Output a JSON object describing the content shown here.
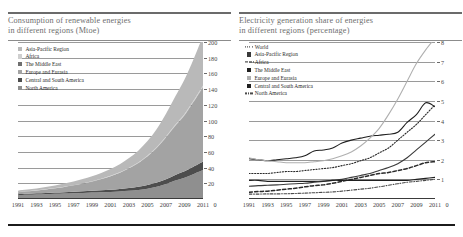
{
  "figure": {
    "bottom_rule_color": "#1b1b1b"
  },
  "left_panel": {
    "title_line1": "Consumption of renewable energies",
    "title_line2": "in different regions (Mtoe)",
    "legend": [
      {
        "label": "Asia-Pacific Region",
        "style": "swatch",
        "color": "#b9b9b9"
      },
      {
        "label": "Africa",
        "style": "swatch",
        "color": "#cfcfcf"
      },
      {
        "label": "The Middle East",
        "style": "swatch",
        "color": "#6f6f6f"
      },
      {
        "label": "Europe and Eurasia",
        "style": "swatch",
        "color": "#a3a3a3"
      },
      {
        "label": "Central and South America",
        "style": "swatch",
        "color": "#4d4d4d"
      },
      {
        "label": "North America",
        "style": "swatch",
        "color": "#8f8f8f"
      }
    ]
  },
  "right_panel": {
    "title_line1": "Electricity generation share of energies",
    "title_line2": "in different regions (percentage)",
    "legend": [
      {
        "label": "World",
        "style": "dotted",
        "color": "#2a2a2a"
      },
      {
        "label": "Asia-Pacific Region",
        "style": "swatch",
        "color": "#3a3a3a"
      },
      {
        "label": "Africa",
        "style": "dashed",
        "color": "#2a2a2a"
      },
      {
        "label": "The Middle East",
        "style": "swatch",
        "color": "#1f1f1f"
      },
      {
        "label": "Europe and Eurasia",
        "style": "swatch",
        "color": "#b0b0b0"
      },
      {
        "label": "Central and South America",
        "style": "swatch",
        "color": "#202020"
      },
      {
        "label": "North America",
        "style": "dashdot",
        "color": "#4a4a4a"
      }
    ]
  },
  "chart_data": [
    {
      "type": "area",
      "title": "Consumption of renewable energies in different regions (Mtoe)",
      "xlabel": "",
      "ylabel": "Mtoe",
      "stacked": true,
      "grid": true,
      "legend_position": "top-left",
      "x": [
        1991,
        1992,
        1993,
        1994,
        1995,
        1996,
        1997,
        1998,
        1999,
        2000,
        2001,
        2002,
        2003,
        2004,
        2005,
        2006,
        2007,
        2008,
        2009,
        2010,
        2011
      ],
      "xticklabels": [
        "1991",
        "1993",
        "1995",
        "1997",
        "1999",
        "2001",
        "2003",
        "2005",
        "2007",
        "2009",
        "2011",
        "0"
      ],
      "ylim": [
        0,
        200
      ],
      "yticks": [
        0,
        20,
        40,
        60,
        80,
        100,
        120,
        140,
        160,
        180,
        200
      ],
      "series": [
        {
          "name": "North America",
          "color": "#8f8f8f",
          "values": [
            5,
            5.4,
            5.8,
            6.2,
            6.6,
            7,
            7.4,
            7.8,
            8.2,
            8.6,
            9,
            9.6,
            10.4,
            11.6,
            13.2,
            15.6,
            19,
            23.5,
            27,
            32,
            37
          ]
        },
        {
          "name": "Central and South America",
          "color": "#4d4d4d",
          "values": [
            1.2,
            1.3,
            1.4,
            1.5,
            1.6,
            1.7,
            1.9,
            2.1,
            2.3,
            2.6,
            2.9,
            3.2,
            3.6,
            4,
            4.6,
            5.3,
            6.2,
            7.2,
            8.2,
            9.4,
            10.8
          ]
        },
        {
          "name": "Europe and Eurasia",
          "color": "#a3a3a3",
          "values": [
            2.5,
            3,
            3.6,
            4.4,
            5.4,
            6.6,
            8,
            9.6,
            11.6,
            14,
            17,
            20.5,
            25,
            30,
            36.5,
            44,
            53,
            62,
            71,
            82,
            94
          ]
        },
        {
          "name": "The Middle East",
          "color": "#6f6f6f",
          "values": [
            0.05,
            0.05,
            0.06,
            0.06,
            0.07,
            0.08,
            0.09,
            0.1,
            0.12,
            0.14,
            0.16,
            0.18,
            0.2,
            0.25,
            0.3,
            0.35,
            0.4,
            0.5,
            0.6,
            0.7,
            0.9
          ]
        },
        {
          "name": "Africa",
          "color": "#cfcfcf",
          "values": [
            0.1,
            0.12,
            0.14,
            0.16,
            0.19,
            0.22,
            0.26,
            0.3,
            0.35,
            0.4,
            0.46,
            0.54,
            0.62,
            0.72,
            0.84,
            0.98,
            1.14,
            1.3,
            1.5,
            1.7,
            2
          ]
        },
        {
          "name": "Asia-Pacific Region",
          "color": "#b9b9b9",
          "values": [
            1.8,
            2.1,
            2.5,
            2.9,
            3.4,
            4,
            4.7,
            5.5,
            6.4,
            7.5,
            8.8,
            10.4,
            12.4,
            15,
            18.4,
            23,
            29,
            36,
            44,
            53,
            63
          ]
        }
      ]
    },
    {
      "type": "line",
      "title": "Electricity generation share of energies in different regions (percentage)",
      "xlabel": "",
      "ylabel": "percentage",
      "grid": true,
      "legend_position": "top-left",
      "x": [
        1991,
        1992,
        1993,
        1994,
        1995,
        1996,
        1997,
        1998,
        1999,
        2000,
        2001,
        2002,
        2003,
        2004,
        2005,
        2006,
        2007,
        2008,
        2009,
        2010,
        2011
      ],
      "xticklabels": [
        "1991",
        "1993",
        "1995",
        "1997",
        "1999",
        "2001",
        "2003",
        "2005",
        "2007",
        "2009",
        "2011",
        "0"
      ],
      "ylim": [
        0,
        8
      ],
      "yticks": [
        0,
        1,
        2,
        3,
        4,
        5,
        6,
        7,
        8
      ],
      "series": [
        {
          "name": "World",
          "color": "#2a2a2a",
          "dash": "dotted",
          "values": [
            1.3,
            1.3,
            1.3,
            1.35,
            1.4,
            1.4,
            1.45,
            1.5,
            1.55,
            1.6,
            1.7,
            1.8,
            1.95,
            2.1,
            2.35,
            2.6,
            3.0,
            3.4,
            3.8,
            4.3,
            4.8
          ]
        },
        {
          "name": "Asia-Pacific Region",
          "color": "#3a3a3a",
          "dash": "solid",
          "values": [
            0.65,
            0.68,
            0.7,
            0.72,
            0.75,
            0.78,
            0.8,
            0.85,
            0.9,
            0.95,
            1.0,
            1.1,
            1.2,
            1.3,
            1.45,
            1.6,
            1.8,
            2.1,
            2.5,
            2.9,
            3.3
          ]
        },
        {
          "name": "Africa",
          "color": "#2a2a2a",
          "dash": "dashed",
          "values": [
            0.35,
            0.38,
            0.4,
            0.45,
            0.5,
            0.55,
            0.62,
            0.68,
            0.72,
            0.8,
            0.9,
            1.0,
            1.1,
            1.2,
            1.3,
            1.35,
            1.45,
            1.55,
            1.7,
            1.85,
            1.9
          ]
        },
        {
          "name": "The Middle East",
          "color": "#1f1f1f",
          "dash": "solid",
          "values": [
            2.05,
            2.0,
            1.95,
            2.0,
            2.05,
            2.1,
            2.2,
            2.45,
            2.5,
            2.6,
            2.85,
            3.0,
            3.1,
            3.2,
            3.25,
            3.3,
            3.4,
            3.9,
            4.3,
            4.9,
            4.7
          ]
        },
        {
          "name": "Europe and Eurasia",
          "color": "#b0b0b0",
          "dash": "solid",
          "values": [
            2.1,
            2.0,
            1.95,
            1.9,
            1.85,
            1.85,
            1.85,
            1.9,
            1.95,
            2.05,
            2.2,
            2.4,
            2.7,
            3.1,
            3.6,
            4.3,
            5.1,
            6.0,
            6.9,
            7.6,
            8.2
          ]
        },
        {
          "name": "Central and South America",
          "color": "#202020",
          "dash": "solid",
          "values": [
            0.95,
            0.95,
            0.9,
            0.9,
            0.9,
            0.9,
            0.9,
            0.9,
            0.92,
            0.95,
            0.95,
            0.95,
            0.95,
            0.95,
            0.95,
            0.95,
            0.95,
            0.95,
            1.0,
            1.05,
            1.1
          ]
        },
        {
          "name": "North America",
          "color": "#4a4a4a",
          "dash": "dashdot",
          "values": [
            0.25,
            0.25,
            0.26,
            0.26,
            0.27,
            0.28,
            0.3,
            0.32,
            0.34,
            0.36,
            0.4,
            0.45,
            0.5,
            0.55,
            0.62,
            0.7,
            0.78,
            0.85,
            0.9,
            0.95,
            1.0
          ]
        }
      ]
    }
  ]
}
